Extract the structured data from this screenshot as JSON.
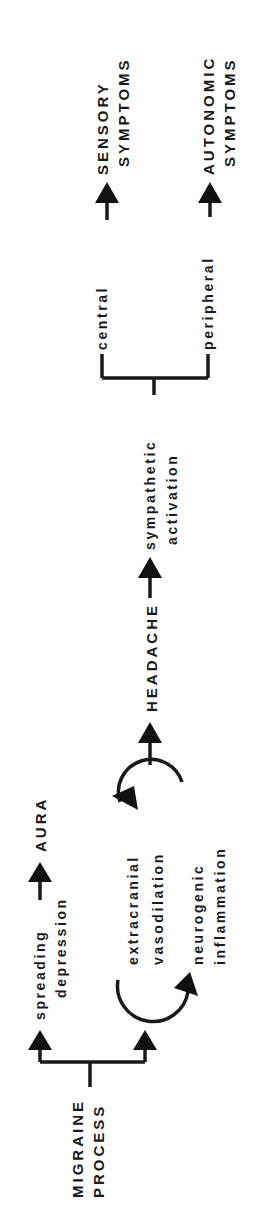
{
  "diagram": {
    "orientation": "rotated-90-ccw",
    "nodes": {
      "migraine_process": {
        "line1": "MIGRAINE",
        "line2": "PROCESS"
      },
      "spreading_depression": {
        "line1": "spreading",
        "line2": "depression"
      },
      "aura": {
        "label": "AURA"
      },
      "extracranial_vasodilation": {
        "line1": "extracranial",
        "line2": "vasodilation"
      },
      "neurogenic_inflammation": {
        "line1": "neurogenic",
        "line2": "inflammation"
      },
      "headache": {
        "label": "HEADACHE"
      },
      "sympathetic_activation": {
        "line1": "sympathetic",
        "line2": "activation"
      },
      "central": {
        "label": "central"
      },
      "peripheral": {
        "label": "peripheral"
      },
      "sensory_symptoms": {
        "line1": "SENSORY",
        "line2": "SYMPTOMS"
      },
      "autonomic_symptoms": {
        "line1": "AUTONOMIC",
        "line2": "SYMPTOMS"
      }
    },
    "edges": [
      {
        "from": "MIGRAINE PROCESS",
        "to": "spreading depression"
      },
      {
        "from": "MIGRAINE PROCESS",
        "to": "extracranial vasodilation"
      },
      {
        "from": "spreading depression",
        "to": "AURA"
      },
      {
        "from": "extracranial vasodilation",
        "to": "neurogenic inflammation",
        "type": "cycle"
      },
      {
        "from": "neurogenic inflammation",
        "to": "extracranial vasodilation",
        "type": "cycle"
      },
      {
        "from": "extracranial vasodilation / neurogenic inflammation",
        "to": "HEADACHE"
      },
      {
        "from": "HEADACHE",
        "to": "sympathetic activation"
      },
      {
        "from": "sympathetic activation",
        "to": "central"
      },
      {
        "from": "sympathetic activation",
        "to": "peripheral"
      },
      {
        "from": "central",
        "to": "SENSORY SYMPTOMS"
      },
      {
        "from": "peripheral",
        "to": "AUTONOMIC SYMPTOMS"
      }
    ],
    "colors": {
      "ink": "#1a1a1a",
      "background": "#ffffff"
    }
  }
}
